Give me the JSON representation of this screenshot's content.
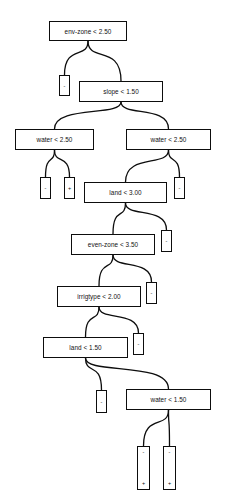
{
  "diagram": {
    "type": "decision-tree",
    "line_color": "#0d0d0d",
    "background_color": "#ffffff",
    "symbols": {
      "negative": "-",
      "positive": "+"
    },
    "nodes": [
      {
        "id": "n0",
        "kind": "split",
        "label": "env-zone < 2.50",
        "x": 49,
        "y": 21,
        "w": 78,
        "h": 20
      },
      {
        "id": "l0",
        "kind": "leaf",
        "label": "-",
        "x": 59,
        "y": 75,
        "w": 11,
        "h": 21
      },
      {
        "id": "n1",
        "kind": "split",
        "label": "slope < 1.50",
        "x": 79,
        "y": 81,
        "w": 84,
        "h": 21
      },
      {
        "id": "n2",
        "kind": "split",
        "label": "water < 2.50",
        "x": 15,
        "y": 129,
        "w": 79,
        "h": 21
      },
      {
        "id": "n3",
        "kind": "split",
        "label": "water < 2.50",
        "x": 126,
        "y": 129,
        "w": 85,
        "h": 21
      },
      {
        "id": "l1",
        "kind": "leaf",
        "label": "-",
        "x": 40,
        "y": 177,
        "w": 11,
        "h": 22
      },
      {
        "id": "l2",
        "kind": "leaf",
        "label": "+",
        "x": 64,
        "y": 177,
        "w": 11,
        "h": 22
      },
      {
        "id": "n4",
        "kind": "split",
        "label": "land < 3.00",
        "x": 84,
        "y": 182,
        "w": 83,
        "h": 21
      },
      {
        "id": "l3",
        "kind": "leaf",
        "label": "-",
        "x": 174,
        "y": 177,
        "w": 11,
        "h": 22
      },
      {
        "id": "n5",
        "kind": "split",
        "label": "even-zone < 3.50",
        "x": 71,
        "y": 234,
        "w": 84,
        "h": 21
      },
      {
        "id": "l4",
        "kind": "leaf",
        "label": "-",
        "x": 161,
        "y": 230,
        "w": 11,
        "h": 22
      },
      {
        "id": "n6",
        "kind": "split",
        "label": "irrigtype < 2.00",
        "x": 57,
        "y": 286,
        "w": 84,
        "h": 21
      },
      {
        "id": "l5",
        "kind": "leaf",
        "label": "-",
        "x": 146,
        "y": 282,
        "w": 11,
        "h": 22
      },
      {
        "id": "n7",
        "kind": "split",
        "label": "land < 1.50",
        "x": 43,
        "y": 337,
        "w": 85,
        "h": 21
      },
      {
        "id": "l6",
        "kind": "leaf",
        "label": "-",
        "x": 133,
        "y": 333,
        "w": 11,
        "h": 22
      },
      {
        "id": "l7",
        "kind": "leaf",
        "label": "-",
        "x": 96,
        "y": 390,
        "w": 11,
        "h": 23
      },
      {
        "id": "n8",
        "kind": "split",
        "label": "water < 1.50",
        "x": 126,
        "y": 389,
        "w": 85,
        "h": 21
      },
      {
        "id": "l8",
        "kind": "leafstack",
        "label_top": "-",
        "label_bottom": "+",
        "x": 137,
        "y": 446,
        "w": 13,
        "h": 44
      },
      {
        "id": "l9",
        "kind": "leafstack",
        "label_top": "-",
        "label_bottom": "+",
        "x": 163,
        "y": 446,
        "w": 13,
        "h": 44
      }
    ],
    "edges": [
      {
        "from": "n0",
        "to": "l0",
        "branch": "left"
      },
      {
        "from": "n0",
        "to": "n1",
        "branch": "right"
      },
      {
        "from": "n1",
        "to": "n2",
        "branch": "left"
      },
      {
        "from": "n1",
        "to": "n3",
        "branch": "right"
      },
      {
        "from": "n2",
        "to": "l1",
        "branch": "left"
      },
      {
        "from": "n2",
        "to": "l2",
        "branch": "right"
      },
      {
        "from": "n3",
        "to": "n4",
        "branch": "left"
      },
      {
        "from": "n3",
        "to": "l3",
        "branch": "right"
      },
      {
        "from": "n4",
        "to": "n5",
        "branch": "left"
      },
      {
        "from": "n4",
        "to": "l4",
        "branch": "right"
      },
      {
        "from": "n5",
        "to": "n6",
        "branch": "left"
      },
      {
        "from": "n5",
        "to": "l5",
        "branch": "right"
      },
      {
        "from": "n6",
        "to": "n7",
        "branch": "left"
      },
      {
        "from": "n6",
        "to": "l6",
        "branch": "right"
      },
      {
        "from": "n7",
        "to": "l7",
        "branch": "left"
      },
      {
        "from": "n7",
        "to": "n8",
        "branch": "right"
      },
      {
        "from": "n8",
        "to": "l8",
        "branch": "left"
      },
      {
        "from": "n8",
        "to": "l9",
        "branch": "right"
      }
    ]
  }
}
